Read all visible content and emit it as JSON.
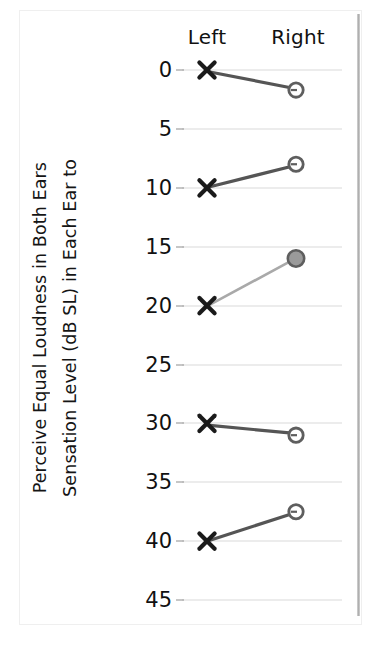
{
  "figure": {
    "y_axis_title_line1": "Sensation Level (dB SL) in Each Ear to",
    "y_axis_title_line2": "Perceive Equal Loudness in Both Ears"
  },
  "colors": {
    "marker_x": "#1a1a1a",
    "marker_circle_stroke": "#5e5e5e",
    "marker_circle_fill_open": "#ffffff",
    "marker_circle_fill_solid": "#9a9a9a",
    "connector_dark": "#555555",
    "connector_light": "#a9a9a9",
    "gridline": "#d9d9d9",
    "axis": "#8d8d8d",
    "text": "#111111",
    "page_edge": "#a8a8a8"
  },
  "chart_data": {
    "type": "line",
    "title": "",
    "subtitle": "",
    "xlabel": "",
    "ylabel": "Sensation Level (dB SL) in Each Ear to Perceive Equal Loudness in Both Ears",
    "categories": [
      "Left",
      "Right"
    ],
    "x_tick_labels": [
      "Left",
      "Right"
    ],
    "y_tick_labels": [
      "0",
      "5",
      "10",
      "15",
      "20",
      "25",
      "30",
      "35",
      "40",
      "45"
    ],
    "y_ticks": [
      0,
      5,
      10,
      15,
      20,
      25,
      30,
      35,
      40,
      45
    ],
    "ylim": [
      45,
      0
    ],
    "y_axis_inverted": true,
    "grid": true,
    "legend": "none",
    "series": [
      {
        "name": "Subject 1",
        "values": [
          0,
          1.7
        ],
        "left_marker": "x",
        "right_marker": "circle-open",
        "connector": "dark"
      },
      {
        "name": "Subject 2",
        "values": [
          10,
          8
        ],
        "left_marker": "x",
        "right_marker": "circle-open",
        "connector": "dark"
      },
      {
        "name": "Subject 3",
        "values": [
          20,
          16
        ],
        "left_marker": "x",
        "right_marker": "circle-filled",
        "connector": "light"
      },
      {
        "name": "Subject 4",
        "values": [
          30,
          31
        ],
        "left_marker": "x",
        "right_marker": "circle-open",
        "connector": "dark"
      },
      {
        "name": "Subject 5",
        "values": [
          40,
          37.5
        ],
        "left_marker": "x",
        "right_marker": "circle-open",
        "connector": "dark"
      }
    ]
  }
}
